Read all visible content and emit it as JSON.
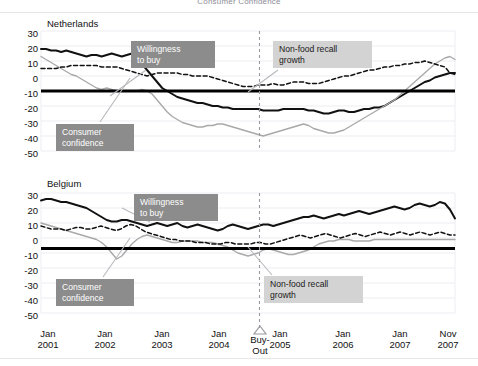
{
  "figure": {
    "title": "Consumer Confidence",
    "width": 478,
    "height": 366,
    "background": "#ffffff"
  },
  "colors": {
    "willingness_to_buy": "#111111",
    "consumer_confidence": "#a9a9a9",
    "non_food_recall_growth": "#111111",
    "zero_line": "#000000",
    "grid": "#e9e9ee",
    "callout_dark_bg": "#8c8c8c",
    "callout_light_bg": "#d3d3d3",
    "buyout_marker": "#9a9aa0"
  },
  "axis": {
    "y_ticks": [
      30,
      20,
      10,
      0,
      -10,
      -20,
      -30,
      -40,
      -50
    ],
    "y_min": -50,
    "y_max": 30,
    "x_ticks": [
      {
        "line1": "Jan",
        "line2": "2001"
      },
      {
        "line1": "Jan",
        "line2": "2002"
      },
      {
        "line1": "Jan",
        "line2": "2003"
      },
      {
        "line1": "Jan",
        "line2": "2004"
      },
      {
        "line1": "Jan",
        "line2": "2005"
      },
      {
        "line1": "Jan",
        "line2": "2006"
      },
      {
        "line1": "Jan",
        "line2": "2007"
      },
      {
        "line1": "Nov",
        "line2": "2007"
      }
    ],
    "buyout": {
      "line1": "Buy-",
      "line2": "Out",
      "marker": "triangle-up-icon"
    }
  },
  "panels": [
    {
      "name": "Netherlands",
      "callouts": [
        {
          "id": "willingness-to-buy",
          "text": "Willingness\nto buy",
          "style": "dark"
        },
        {
          "id": "non-food-recall-growth",
          "text": "Non-food recall\ngrowth",
          "style": "light"
        },
        {
          "id": "consumer-confidence",
          "text": "Consumer\nconfidence",
          "style": "dark"
        }
      ]
    },
    {
      "name": "Belgium",
      "callouts": [
        {
          "id": "willingness-to-buy",
          "text": "Willingness\nto buy",
          "style": "dark"
        },
        {
          "id": "consumer-confidence",
          "text": "Consumer\nconfidence",
          "style": "dark"
        },
        {
          "id": "non-food-recall-growth",
          "text": "Non-food recall\ngrowth",
          "style": "light"
        }
      ]
    }
  ],
  "chart_data": {
    "type": "line",
    "title": "Consumer Confidence",
    "xlabel": "",
    "ylabel": "",
    "ylim": [
      -50,
      30
    ],
    "grid": true,
    "legend": "inline-callouts",
    "x_start": "Jan 2001",
    "x_end": "Nov 2007",
    "x_unit": "month",
    "n_points": 83,
    "annotations": [
      {
        "label": "Buy-Out",
        "x": "Oct 2004",
        "marker": "triangle-up",
        "vertical_dashed_line": true
      }
    ],
    "panels": [
      {
        "name": "Netherlands",
        "series": [
          {
            "name": "Willingness to buy",
            "style": "solid",
            "color": "#111111",
            "values": [
              18,
              18,
              17,
              17,
              16,
              17,
              16,
              15,
              14,
              13,
              14,
              14,
              13,
              14,
              15,
              14,
              13,
              14,
              15,
              14,
              8,
              4,
              0,
              -4,
              -8,
              -10,
              -12,
              -14,
              -15,
              -16,
              -17,
              -18,
              -18,
              -19,
              -20,
              -20,
              -21,
              -21,
              -22,
              -22,
              -22,
              -22,
              -22,
              -22,
              -23,
              -23,
              -23,
              -23,
              -22,
              -22,
              -22,
              -22,
              -22,
              -23,
              -23,
              -24,
              -25,
              -25,
              -24,
              -23,
              -23,
              -24,
              -24,
              -23,
              -22,
              -22,
              -21,
              -21,
              -20,
              -18,
              -16,
              -14,
              -12,
              -10,
              -8,
              -6,
              -4,
              -3,
              -1,
              0,
              1,
              2,
              2
            ]
          },
          {
            "name": "Consumer confidence",
            "style": "solid",
            "color": "#a9a9a9",
            "values": [
              13,
              11,
              9,
              7,
              5,
              3,
              1,
              0,
              -2,
              -4,
              -6,
              -8,
              -9,
              -8,
              -9,
              -10,
              -10,
              -10,
              -10,
              -10,
              -9,
              -10,
              -12,
              -16,
              -20,
              -24,
              -27,
              -29,
              -31,
              -32,
              -33,
              -34,
              -34,
              -33,
              -33,
              -32,
              -32,
              -33,
              -34,
              -35,
              -36,
              -37,
              -38,
              -39,
              -40,
              -39,
              -38,
              -37,
              -36,
              -35,
              -34,
              -33,
              -32,
              -33,
              -35,
              -36,
              -37,
              -38,
              -38,
              -37,
              -36,
              -34,
              -32,
              -30,
              -28,
              -26,
              -24,
              -22,
              -20,
              -18,
              -16,
              -13,
              -10,
              -7,
              -4,
              -1,
              2,
              5,
              8,
              10,
              12,
              13,
              11
            ]
          },
          {
            "name": "Non-food recall growth",
            "style": "dashed",
            "color": "#111111",
            "values": [
              5,
              5,
              5,
              5,
              6,
              6,
              7,
              7,
              7,
              7,
              7,
              7,
              6,
              6,
              6,
              6,
              5,
              4,
              3,
              2,
              1,
              0,
              1,
              2,
              2,
              2,
              2,
              2,
              1,
              1,
              0,
              0,
              0,
              0,
              -1,
              -2,
              -3,
              -4,
              -5,
              -6,
              -7,
              -7,
              -7,
              -6,
              -6,
              -6,
              -5,
              -6,
              -6,
              -5,
              -4,
              -4,
              -4,
              -5,
              -5,
              -5,
              -4,
              -3,
              -2,
              -1,
              0,
              0,
              1,
              2,
              3,
              4,
              4,
              5,
              6,
              6,
              7,
              7,
              8,
              8,
              9,
              9,
              10,
              9,
              8,
              7,
              6,
              2,
              1
            ]
          }
        ]
      },
      {
        "name": "Belgium",
        "series": [
          {
            "name": "Willingness to buy",
            "style": "solid",
            "color": "#111111",
            "values": [
              25,
              26,
              26,
              25,
              24,
              24,
              23,
              22,
              21,
              20,
              18,
              16,
              14,
              12,
              11,
              11,
              12,
              12,
              11,
              10,
              9,
              8,
              9,
              10,
              9,
              8,
              9,
              10,
              8,
              7,
              8,
              9,
              8,
              7,
              6,
              5,
              6,
              8,
              9,
              8,
              7,
              6,
              7,
              8,
              9,
              9,
              8,
              9,
              10,
              11,
              12,
              13,
              14,
              14,
              15,
              14,
              13,
              14,
              15,
              16,
              15,
              16,
              17,
              18,
              17,
              16,
              17,
              18,
              19,
              20,
              21,
              20,
              19,
              20,
              22,
              23,
              22,
              21,
              22,
              24,
              23,
              19,
              13
            ]
          },
          {
            "name": "Consumer confidence",
            "style": "solid",
            "color": "#a9a9a9",
            "values": [
              10,
              9,
              8,
              7,
              6,
              5,
              4,
              3,
              2,
              1,
              0,
              -1,
              -3,
              -6,
              -10,
              -14,
              -12,
              -8,
              -4,
              -1,
              1,
              2,
              1,
              0,
              -1,
              -2,
              -3,
              -3,
              -2,
              -2,
              -2,
              -2,
              -3,
              -3,
              -3,
              -4,
              -5,
              -6,
              -8,
              -10,
              -11,
              -12,
              -11,
              -10,
              -8,
              -7,
              -8,
              -9,
              -10,
              -11,
              -11,
              -10,
              -9,
              -8,
              -6,
              -4,
              -3,
              -2,
              -2,
              -1,
              -1,
              -1,
              -2,
              -2,
              -2,
              -2,
              -1,
              -1,
              -1,
              -1,
              -1,
              -1,
              -1,
              -1,
              -1,
              -1,
              -1,
              -1,
              -1,
              -1,
              -1,
              -1,
              -1
            ]
          },
          {
            "name": "Non-food recall growth",
            "style": "dashed",
            "color": "#111111",
            "values": [
              8,
              7,
              6,
              6,
              6,
              5,
              6,
              7,
              7,
              6,
              6,
              7,
              8,
              7,
              6,
              5,
              6,
              8,
              9,
              8,
              6,
              4,
              3,
              2,
              1,
              0,
              -1,
              -1,
              -2,
              -2,
              -2,
              -3,
              -3,
              -3,
              -4,
              -4,
              -4,
              -3,
              -3,
              -4,
              -4,
              -4,
              -4,
              -3,
              -3,
              -4,
              -4,
              -3,
              -2,
              -1,
              0,
              1,
              2,
              1,
              0,
              1,
              2,
              3,
              2,
              1,
              0,
              1,
              2,
              3,
              2,
              1,
              2,
              3,
              4,
              3,
              2,
              3,
              4,
              3,
              2,
              3,
              4,
              3,
              2,
              3,
              4,
              3,
              2,
              2
            ]
          }
        ]
      }
    ]
  }
}
